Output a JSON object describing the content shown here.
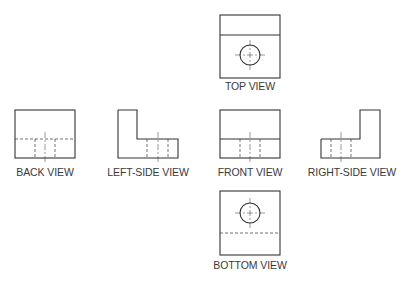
{
  "diagram": {
    "type": "orthographic-projection",
    "stroke_color": "#333333",
    "views": [
      {
        "id": "top",
        "label": "TOP VIEW"
      },
      {
        "id": "back",
        "label": "BACK VIEW"
      },
      {
        "id": "left-side",
        "label": "LEFT-SIDE VIEW"
      },
      {
        "id": "front",
        "label": "FRONT VIEW"
      },
      {
        "id": "right-side",
        "label": "RIGHT-SIDE VIEW"
      },
      {
        "id": "bottom",
        "label": "BOTTOM VIEW"
      }
    ]
  }
}
